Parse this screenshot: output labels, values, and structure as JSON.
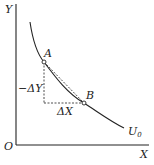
{
  "diagram": {
    "type": "indifference-curve",
    "axes": {
      "y_label": "Y",
      "x_label": "X",
      "origin_label": "O"
    },
    "curve": {
      "label": "U",
      "label_subscript": "0"
    },
    "points": [
      {
        "label": "A"
      },
      {
        "label": "B"
      }
    ],
    "annotations": {
      "delta_y": "−ΔY",
      "delta_x": "ΔX"
    },
    "colors": {
      "line": "#222222",
      "background": "#ffffff"
    }
  }
}
